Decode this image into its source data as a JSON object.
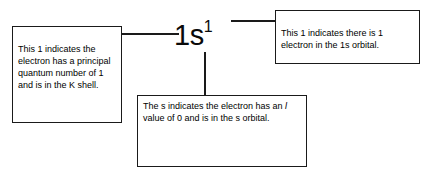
{
  "diagram": {
    "type": "annotated-electron-configuration",
    "notation": {
      "base": "1s",
      "superscript": "1"
    },
    "callouts": [
      {
        "id": "principal-quantum-number",
        "text": "This 1 indicates the electron has a principal quantum number of 1 and is in the K shell."
      },
      {
        "id": "subshell-s",
        "text_before_italic": "The s indicates the electron has an ",
        "italic_symbol": "l",
        "text_after_italic": " value of 0 and is in the s orbital."
      },
      {
        "id": "electron-count",
        "text": "This 1 indicates there is 1 electron in the 1s orbital."
      }
    ],
    "colors": {
      "background": "#ffffff",
      "line": "#1a1a1a",
      "text": "#000000"
    }
  }
}
